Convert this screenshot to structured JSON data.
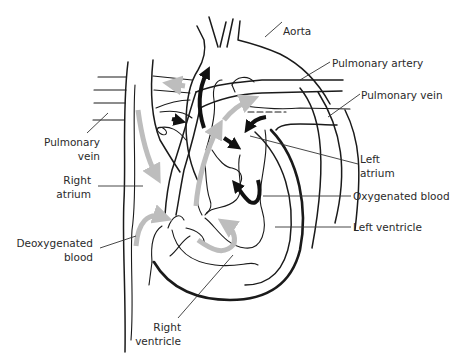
{
  "diagram": {
    "labels": {
      "aorta": "Aorta",
      "pulmonary_artery": "Pulmonary artery",
      "pulmonary_vein_right": "Pulmonary vein",
      "pulmonary_vein_left_line1": "Pulmonary",
      "pulmonary_vein_left_line2": "vein",
      "left_atrium_line1": "Left",
      "left_atrium_line2": "atrium",
      "right_atrium_line1": "Right",
      "right_atrium_line2": "atrium",
      "oxygenated_blood": "Oxygenated blood",
      "left_ventricle": "Left ventricle",
      "deoxygenated_blood_line1": "Deoxygenated",
      "deoxygenated_blood_line2": "blood",
      "right_ventricle_line1": "Right",
      "right_ventricle_line2": "ventricle"
    },
    "legend": {
      "grey_arrows": "Deoxygenated blood",
      "black_arrows": "Oxygenated blood"
    },
    "colors": {
      "outline": "#1a1a1a",
      "deoxygenated_arrow": "#bdbdbd",
      "oxygenated_arrow": "#111111",
      "background": "#ffffff"
    }
  }
}
